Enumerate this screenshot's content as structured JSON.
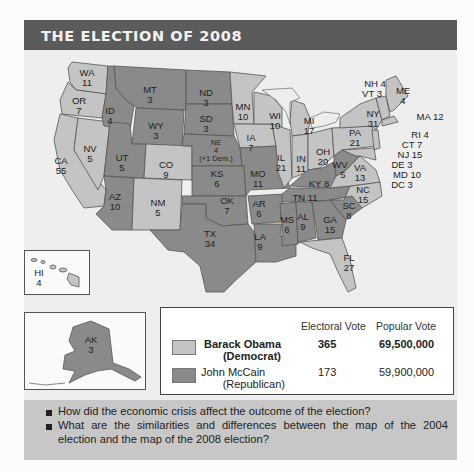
{
  "title": "THE ELECTION OF 2008",
  "colors": {
    "democrat": "#c4c4c4",
    "republican": "#8a8a8a",
    "title_bar": "#5b5b5b",
    "question_bg": "#c7c7c7"
  },
  "states": {
    "WA": {
      "label": "WA",
      "ev": "11",
      "party": "democrat"
    },
    "OR": {
      "label": "OR",
      "ev": "7",
      "party": "democrat"
    },
    "CA": {
      "label": "CA",
      "ev": "55",
      "party": "democrat"
    },
    "NV": {
      "label": "NV",
      "ev": "5",
      "party": "democrat"
    },
    "ID": {
      "label": "ID",
      "ev": "4",
      "party": "republican"
    },
    "MT": {
      "label": "MT",
      "ev": "3",
      "party": "republican"
    },
    "WY": {
      "label": "WY",
      "ev": "3",
      "party": "republican"
    },
    "UT": {
      "label": "UT",
      "ev": "5",
      "party": "republican"
    },
    "AZ": {
      "label": "AZ",
      "ev": "10",
      "party": "republican"
    },
    "CO": {
      "label": "CO",
      "ev": "9",
      "party": "democrat"
    },
    "NM": {
      "label": "NM",
      "ev": "5",
      "party": "democrat"
    },
    "ND": {
      "label": "ND",
      "ev": "3",
      "party": "republican"
    },
    "SD": {
      "label": "SD",
      "ev": "3",
      "party": "republican"
    },
    "NE": {
      "label": "NE",
      "ev": "4",
      "note": "(+1 Dem.)",
      "party": "republican"
    },
    "KS": {
      "label": "KS",
      "ev": "6",
      "party": "republican"
    },
    "OK": {
      "label": "OK",
      "ev": "7",
      "party": "republican"
    },
    "TX": {
      "label": "TX",
      "ev": "34",
      "party": "republican"
    },
    "MN": {
      "label": "MN",
      "ev": "10",
      "party": "democrat"
    },
    "IA": {
      "label": "IA",
      "ev": "7",
      "party": "democrat"
    },
    "MO": {
      "label": "MO",
      "ev": "11",
      "party": "republican"
    },
    "AR": {
      "label": "AR",
      "ev": "6",
      "party": "republican"
    },
    "LA": {
      "label": "LA",
      "ev": "9",
      "party": "republican"
    },
    "WI": {
      "label": "WI",
      "ev": "10",
      "party": "democrat"
    },
    "IL": {
      "label": "IL",
      "ev": "21",
      "party": "democrat"
    },
    "MI": {
      "label": "MI",
      "ev": "17",
      "party": "democrat"
    },
    "IN": {
      "label": "IN",
      "ev": "11",
      "party": "democrat"
    },
    "OH": {
      "label": "OH",
      "ev": "20",
      "party": "democrat"
    },
    "KY": {
      "label": "KY",
      "ev": "8",
      "party": "republican"
    },
    "TN": {
      "label": "TN",
      "ev": "11",
      "party": "republican"
    },
    "MS": {
      "label": "MS",
      "ev": "6",
      "party": "republican"
    },
    "AL": {
      "label": "AL",
      "ev": "9",
      "party": "republican"
    },
    "GA": {
      "label": "GA",
      "ev": "15",
      "party": "republican"
    },
    "FL": {
      "label": "FL",
      "ev": "27",
      "party": "democrat"
    },
    "SC": {
      "label": "SC",
      "ev": "8",
      "party": "republican"
    },
    "NC": {
      "label": "NC",
      "ev": "15",
      "party": "democrat"
    },
    "VA": {
      "label": "VA",
      "ev": "13",
      "party": "democrat"
    },
    "WV": {
      "label": "WV",
      "ev": "5",
      "party": "republican"
    },
    "PA": {
      "label": "PA",
      "ev": "21",
      "party": "democrat"
    },
    "NY": {
      "label": "NY",
      "ev": "31",
      "party": "democrat"
    },
    "ME": {
      "label": "ME",
      "ev": "4",
      "party": "democrat"
    },
    "HI": {
      "label": "HI",
      "ev": "4",
      "party": "democrat"
    },
    "AK": {
      "label": "AK",
      "ev": "3",
      "party": "republican"
    }
  },
  "callouts": {
    "nh": "NH 4",
    "vt": "VT 3",
    "ma": "MA 12",
    "ri": "RI 4",
    "ct": "CT 7",
    "nj": "NJ 15",
    "de": "DE 3",
    "md": "MD 10",
    "dc": "DC 3"
  },
  "legend": {
    "col_electoral": "Electoral Vote",
    "col_popular": "Popular Vote",
    "rows": [
      {
        "name": "Barack Obama",
        "party": "(Democrat)",
        "electoral": "365",
        "popular": "69,500,000",
        "color": "#c4c4c4"
      },
      {
        "name": "John McCain",
        "party": "(Republican)",
        "electoral": "173",
        "popular": "59,900,000",
        "color": "#8a8a8a"
      }
    ]
  },
  "questions": [
    "How did the economic crisis affect the outcome of the election?",
    "What are the similarities and differences between the map of the 2004 election and the map of the 2008 election?"
  ],
  "questions_display": {
    "q2_line1": "What are the similarities and differences between the map of the 2004",
    "q2_line2": "election and the map of the 2008 election?"
  }
}
